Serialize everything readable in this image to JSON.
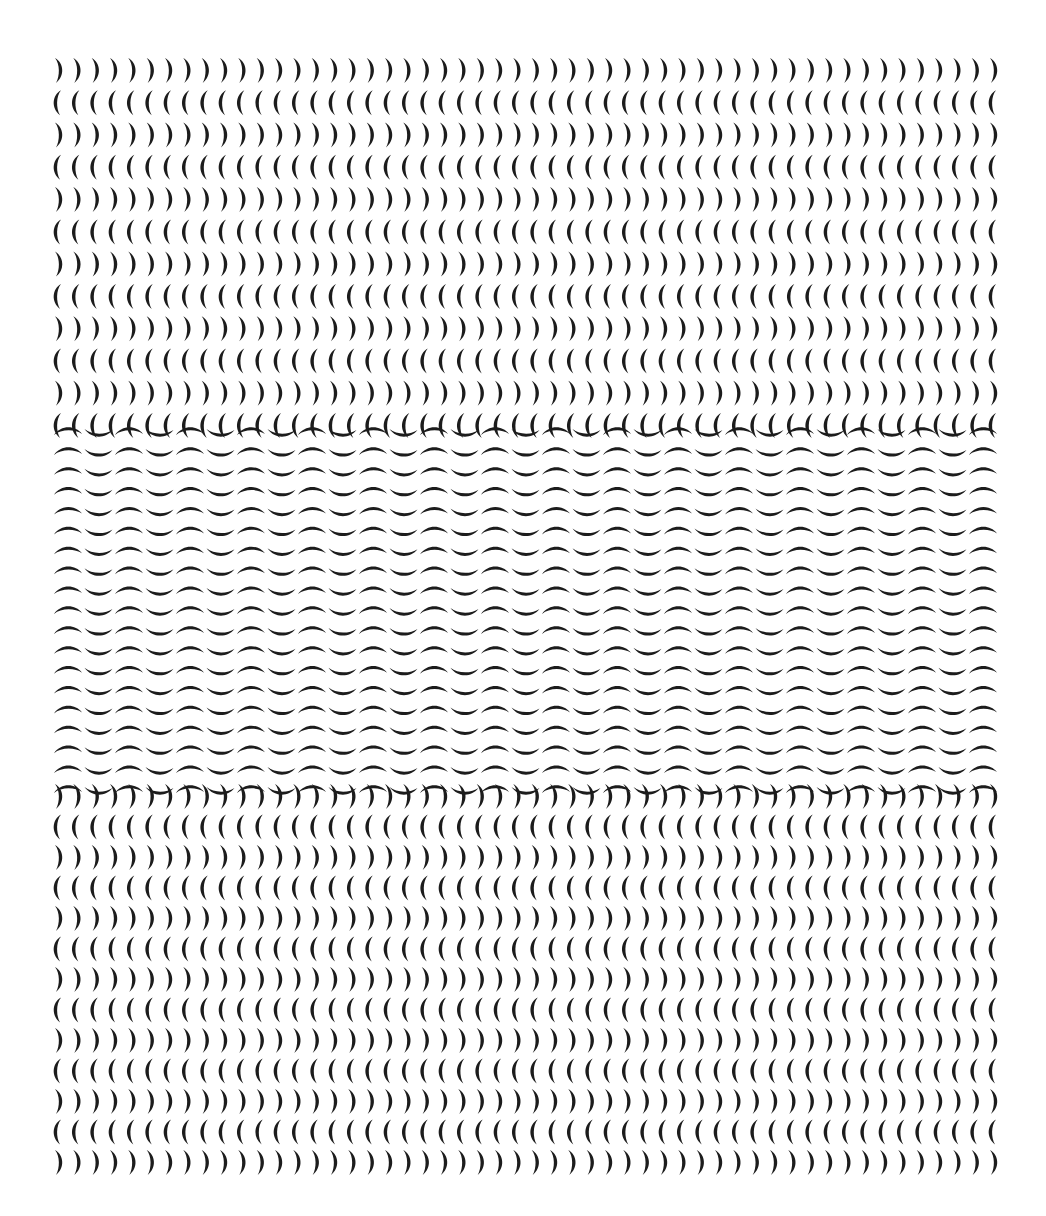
{
  "artwork": {
    "description": "Black-and-white brush-stroke crescent pattern in three horizontal bands",
    "background": "#ffffff",
    "ink": "#1c1c1c",
    "bounds": {
      "left": 58,
      "right": 993,
      "top": 70,
      "bottom": 1162
    },
    "bands": [
      {
        "name": "top-vertical-crescents",
        "orientation": "vertical",
        "y_start": 70,
        "y_end": 425,
        "rows": 12,
        "cols": 52,
        "first_row": "right",
        "pattern": "alternating rows ) and ("
      },
      {
        "name": "middle-wave-crescents",
        "orientation": "horizontal",
        "y_start": 432,
        "y_end": 790,
        "rows": 19,
        "cols": 31,
        "pattern": "alternating frown/smile within row forming waves"
      },
      {
        "name": "bottom-vertical-crescents",
        "orientation": "vertical",
        "y_start": 796,
        "y_end": 1162,
        "rows": 13,
        "cols": 52,
        "first_row": "right",
        "pattern": "alternating rows ) and ("
      }
    ]
  }
}
